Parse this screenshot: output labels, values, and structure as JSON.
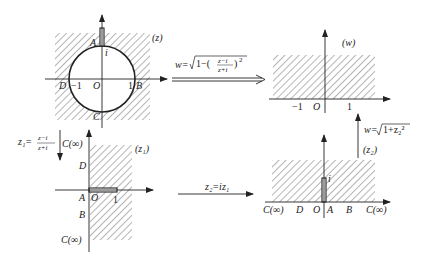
{
  "panels": {
    "z": {
      "plane_label": "(z)",
      "point_A": "A",
      "point_i": "i",
      "point_D": "D",
      "tick_neg1": "−1",
      "origin": "O",
      "tick_1": "1",
      "point_B": "B",
      "point_C": "C"
    },
    "w": {
      "plane_label": "(w)",
      "tick_neg1": "−1",
      "origin": "O",
      "tick_1": "1"
    },
    "z1": {
      "plane_label": "(z₁)",
      "point_C_top": "C(∞)",
      "point_D": "D",
      "point_A": "A",
      "origin": "O",
      "tick_1": "1",
      "point_B": "B",
      "point_C_bottom": "C(∞)"
    },
    "z2": {
      "plane_label": "(z₂)",
      "point_i": "i",
      "point_C_left": "C(∞)",
      "point_D": "D",
      "origin": "O",
      "point_A": "A",
      "point_B": "B",
      "point_C_right": "C(∞)"
    }
  },
  "mappings": {
    "z_to_w": {
      "lhs": "w=",
      "radicand_prefix": "1−(",
      "num": "z−i",
      "den": "z+i",
      "suffix": ")",
      "power": "2"
    },
    "z_to_z1": {
      "lhs": "z₁=",
      "num": "z−i",
      "den": "z+i"
    },
    "z1_to_z2": {
      "formula": "z₂=iz₁"
    },
    "z2_to_w": {
      "lhs": "w=",
      "radicand": "1+z₂²"
    }
  },
  "colors": {
    "ink": "#222222",
    "background": "#ffffff"
  }
}
